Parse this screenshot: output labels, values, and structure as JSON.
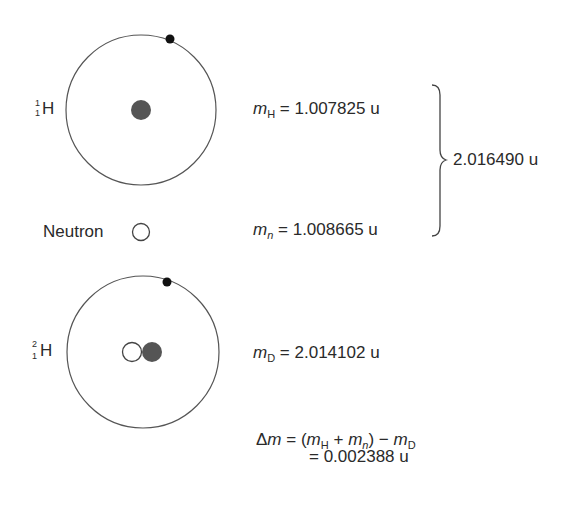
{
  "diagram": {
    "hydrogen": {
      "symbol": "H",
      "mass_number": "1",
      "atomic_number": "1",
      "mass_label_var": "m",
      "mass_label_sub": "H",
      "mass_value": "= 1.007825 u"
    },
    "neutron": {
      "label": "Neutron",
      "mass_label_var": "m",
      "mass_label_sub": "n",
      "mass_value": "= 1.008665 u"
    },
    "sum": {
      "value": "2.016490 u"
    },
    "deuterium": {
      "symbol": "H",
      "mass_number": "2",
      "atomic_number": "1",
      "mass_label_var": "m",
      "mass_label_sub": "D",
      "mass_value": "= 2.014102 u"
    },
    "mass_defect": {
      "delta": "Δ",
      "var": "m",
      "eq": "=",
      "open": "(",
      "mH_var": "m",
      "mH_sub": "H",
      "plus": "+",
      "mn_var": "m",
      "mn_sub": "n",
      "close": ")",
      "minus": "−",
      "mD_var": "m",
      "mD_sub": "D",
      "result": "= 0.002388 u"
    },
    "colors": {
      "line": "#555555",
      "nucleus_proton": "#555555",
      "electron": "#111111"
    }
  }
}
